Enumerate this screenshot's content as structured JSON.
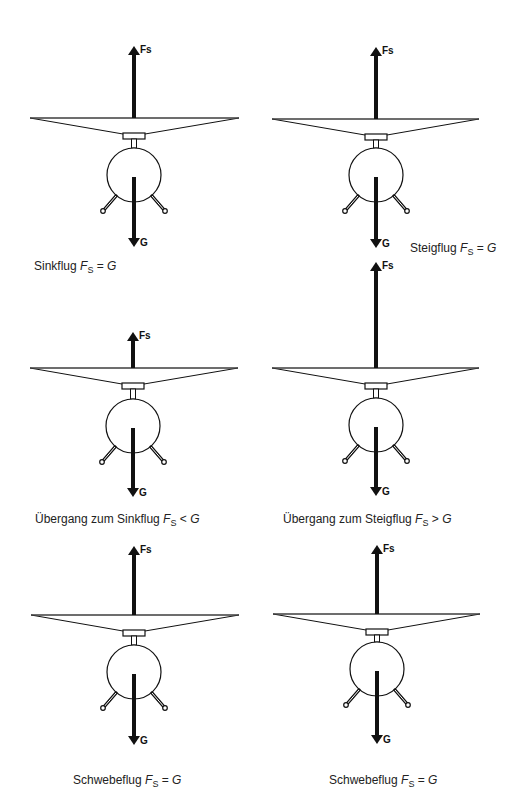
{
  "figure": {
    "colors": {
      "ink": "#111111",
      "text": "#222222",
      "background": "#ffffff"
    },
    "panels": [
      {
        "id": "sinkflug",
        "caption": {
          "name": "Sinkflug",
          "symbol": "F",
          "subscript": "S",
          "relation": "=",
          "rhs": "G"
        },
        "lift_label": "Fs",
        "weight_label": "G",
        "cx": 134,
        "fs_tip": 46,
        "rotor_y": 118,
        "rotor_left": 30,
        "rotor_right": 239,
        "body_cy": 175,
        "g_start": 177,
        "g_tip": 247,
        "caption_x": 34,
        "caption_y": 259
      },
      {
        "id": "steigflug",
        "caption": {
          "name": "Steigflug",
          "symbol": "F",
          "subscript": "S",
          "relation": "=",
          "rhs": "G"
        },
        "lift_label": "Fs",
        "weight_label": "G",
        "cx": 376,
        "fs_tip": 47,
        "rotor_y": 119,
        "rotor_left": 272,
        "rotor_right": 479,
        "body_cy": 175,
        "g_start": 177,
        "g_tip": 248,
        "caption_x": 410,
        "caption_y": 241
      },
      {
        "id": "uebergang-sinkflug",
        "caption": {
          "name": "Übergang zum Sinkflug",
          "symbol": "F",
          "subscript": "S",
          "relation": "<",
          "rhs": "G"
        },
        "lift_label": "Fs",
        "weight_label": "G",
        "cx": 133,
        "fs_tip": 332,
        "rotor_y": 368,
        "rotor_left": 30,
        "rotor_right": 238,
        "body_cy": 426,
        "g_start": 428,
        "g_tip": 497,
        "caption_x": 35,
        "caption_y": 512
      },
      {
        "id": "uebergang-steigflug",
        "caption": {
          "name": "Übergang zum Steigflug",
          "symbol": "F",
          "subscript": "S",
          "relation": ">",
          "rhs": "G"
        },
        "lift_label": "Fs",
        "weight_label": "G",
        "cx": 376,
        "fs_tip": 262,
        "rotor_y": 368,
        "rotor_left": 272,
        "rotor_right": 479,
        "body_cy": 425,
        "g_start": 427,
        "g_tip": 496,
        "caption_x": 283,
        "caption_y": 512
      },
      {
        "id": "schwebeflug-1",
        "caption": {
          "name": "Schwebeflug",
          "symbol": "F",
          "subscript": "S",
          "relation": "=",
          "rhs": "G"
        },
        "lift_label": "Fs",
        "weight_label": "G",
        "cx": 134,
        "fs_tip": 546,
        "rotor_y": 615,
        "rotor_left": 31,
        "rotor_right": 239,
        "body_cy": 672,
        "g_start": 674,
        "g_tip": 745,
        "caption_x": 73,
        "caption_y": 773
      },
      {
        "id": "schwebeflug-2",
        "caption": {
          "name": "Schwebeflug",
          "symbol": "F",
          "subscript": "S",
          "relation": "=",
          "rhs": "G"
        },
        "lift_label": "Fs",
        "weight_label": "G",
        "cx": 377,
        "fs_tip": 545,
        "rotor_y": 614,
        "rotor_left": 273,
        "rotor_right": 480,
        "body_cy": 669,
        "g_start": 671,
        "g_tip": 744,
        "caption_x": 329,
        "caption_y": 773
      }
    ]
  }
}
